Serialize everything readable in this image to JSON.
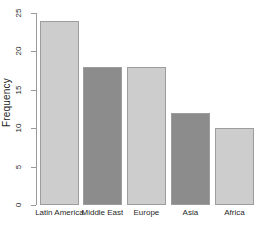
{
  "chart_data": {
    "type": "bar",
    "title": "",
    "subtitle": "",
    "xlabel": "",
    "ylabel": "Frequency",
    "categories": [
      "Latin America",
      "Middle East",
      "Europe",
      "Asia",
      "Africa"
    ],
    "values": [
      24,
      18,
      18,
      12,
      10
    ],
    "ylim": [
      0,
      25
    ],
    "ytick_values": [
      0,
      5,
      10,
      15,
      20,
      25
    ],
    "ytick_labels": [
      "0",
      "5",
      "10",
      "15",
      "20",
      "25"
    ],
    "grid": false,
    "legend": null,
    "bar_colors": [
      "#cdcdcd",
      "#8c8c8c",
      "#cdcdcd",
      "#8c8c8c",
      "#cdcdcd"
    ],
    "bar_border_color": "#9d9d9d",
    "axis_color": "#9a9a9a",
    "background": "#ffffff"
  }
}
